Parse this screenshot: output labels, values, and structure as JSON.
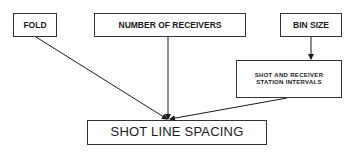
{
  "diagram": {
    "type": "flowchart",
    "nodes": {
      "fold": {
        "label": "FOLD"
      },
      "receivers": {
        "label": "NUMBER OF RECEIVERS"
      },
      "bin_size": {
        "label": "BIN SIZE"
      },
      "intervals": {
        "line1": "SHOT AND RECEIVER",
        "line2": "STATION INTERVALS"
      },
      "spacing": {
        "label": "SHOT LINE SPACING"
      }
    },
    "edges": [
      {
        "from": "FOLD",
        "to": "SHOT LINE SPACING"
      },
      {
        "from": "NUMBER OF RECEIVERS",
        "to": "SHOT LINE SPACING"
      },
      {
        "from": "BIN SIZE",
        "to": "SHOT AND RECEIVER STATION INTERVALS"
      },
      {
        "from": "SHOT AND RECEIVER STATION INTERVALS",
        "to": "SHOT LINE SPACING"
      }
    ],
    "colors": {
      "line": "#1a1a1a",
      "border": "#333333",
      "background": "#ffffff"
    }
  }
}
